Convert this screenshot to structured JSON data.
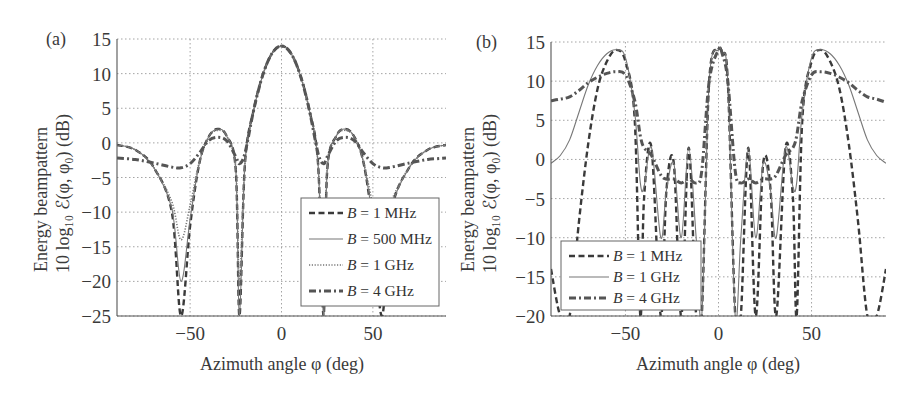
{
  "figure": {
    "panels": [
      {
        "tag": "(a)",
        "ylabel_line1": "Energy beampattern",
        "ylabel_line2": "10 log₁₀ ℰ(φ, φ₀) (dB)",
        "xlabel": "Azimuth angle φ (deg)",
        "yticks": [
          "15",
          "10",
          "5",
          "0",
          "−5",
          "−10",
          "−15",
          "−20",
          "−25"
        ],
        "xticks": [
          "−50",
          "0",
          "50"
        ],
        "legend": [
          "B = 1 MHz",
          "B = 500 MHz",
          "B = 1 GHz",
          "B = 4 GHz"
        ]
      },
      {
        "tag": "(b)",
        "ylabel_line1": "Energy beampattern",
        "ylabel_line2": "10 log₁₀ ℰ(φ, φ₀) (dB)",
        "xlabel": "Azimuth angle φ (deg)",
        "yticks": [
          "15",
          "10",
          "5",
          "0",
          "−5",
          "−10",
          "−15",
          "−20"
        ],
        "xticks": [
          "−50",
          "0",
          "50"
        ],
        "legend": [
          "B = 1 MHz",
          "B = 1 GHz",
          "B = 4 GHz"
        ]
      }
    ]
  },
  "chart_data": [
    {
      "type": "line",
      "panel": "(a)",
      "title": "",
      "xlabel": "Azimuth angle φ (deg)",
      "ylabel": "Energy beampattern 10 log10 ℰ(φ, φ0) (dB)",
      "xlim": [
        -90,
        90
      ],
      "ylim": [
        -25,
        15
      ],
      "grid": true,
      "legend_position": "lower right",
      "x": [
        -90,
        -80,
        -70,
        -60,
        -55,
        -50,
        -45,
        -40,
        -35,
        -30,
        -25,
        -23,
        -20,
        -15,
        -10,
        -5,
        0,
        5,
        10,
        15,
        20,
        23,
        25,
        30,
        35,
        40,
        45,
        50,
        55,
        60,
        70,
        80,
        90
      ],
      "series": [
        {
          "name": "B = 1 MHz",
          "style": "dashed",
          "values": [
            -0.3,
            -1.0,
            -3.5,
            -10,
            -25,
            -12,
            -3,
            0.8,
            2.0,
            1.0,
            -4,
            -25,
            -3,
            5,
            10,
            13,
            14,
            13,
            10,
            5,
            -3,
            -25,
            -4,
            1.0,
            2.0,
            0.8,
            -3,
            -12,
            -25,
            -10,
            -3.5,
            -1.0,
            -0.3
          ]
        },
        {
          "name": "B = 500 MHz",
          "style": "solid",
          "values": [
            -0.3,
            -1.0,
            -3.5,
            -9.5,
            -20,
            -11,
            -3,
            0.8,
            2.0,
            1.0,
            -4,
            -25,
            -3,
            5,
            10,
            13,
            14,
            13,
            10,
            5,
            -3,
            -25,
            -4,
            1.0,
            2.0,
            0.8,
            -3,
            -11,
            -20,
            -9.5,
            -3.5,
            -1.0,
            -0.3
          ]
        },
        {
          "name": "B = 1 GHz",
          "style": "dotted",
          "values": [
            -0.3,
            -1.0,
            -3.5,
            -8.5,
            -14,
            -9,
            -2.8,
            0.8,
            1.8,
            1.0,
            -3.5,
            -20,
            -3,
            5,
            10,
            13,
            14,
            13,
            10,
            5,
            -3,
            -20,
            -3.5,
            1.0,
            1.8,
            0.8,
            -2.8,
            -9,
            -14,
            -8.5,
            -3.5,
            -1.0,
            -0.3
          ]
        },
        {
          "name": "B = 4 GHz",
          "style": "dash-dot",
          "values": [
            -2.2,
            -2.4,
            -2.9,
            -3.5,
            -3.6,
            -3.0,
            -1.5,
            0.3,
            0.8,
            0.3,
            -2.0,
            -3.0,
            -1.5,
            5,
            10,
            13,
            14,
            13,
            10,
            5,
            -1.5,
            -3.0,
            -2.0,
            0.3,
            0.8,
            0.3,
            -1.5,
            -3.0,
            -3.6,
            -3.5,
            -2.9,
            -2.4,
            -2.2
          ]
        }
      ]
    },
    {
      "type": "line",
      "panel": "(b)",
      "title": "",
      "xlabel": "Azimuth angle φ (deg)",
      "ylabel": "Energy beampattern 10 log10 ℰ(φ, φ0) (dB)",
      "xlim": [
        -90,
        90
      ],
      "ylim": [
        -20,
        15
      ],
      "grid": true,
      "legend_position": "lower left",
      "x": [
        -90,
        -85,
        -80,
        -75,
        -70,
        -65,
        -60,
        -55,
        -50,
        -45,
        -42,
        -40,
        -36,
        -31,
        -28,
        -24,
        -20,
        -16,
        -12,
        -9,
        -5,
        0,
        2,
        5,
        9,
        12,
        16,
        20,
        24,
        28,
        31,
        36,
        40,
        42,
        45,
        50,
        55,
        60,
        65,
        70,
        75,
        80,
        85,
        90
      ],
      "series": [
        {
          "name": "B = 1 MHz",
          "style": "dashed",
          "values": [
            -14,
            -20,
            -20,
            -8,
            2,
            9,
            12.5,
            14,
            12.5,
            5,
            -20,
            -5,
            1.5,
            -20,
            -4,
            -0.5,
            -20,
            1.5,
            -20,
            -20,
            10,
            14,
            13.5,
            10,
            -20,
            -20,
            1.5,
            -20,
            -0.5,
            -4,
            -20,
            1.5,
            -5,
            -20,
            5,
            12.5,
            14,
            12.5,
            9,
            2,
            -8,
            -20,
            -20,
            -14
          ]
        },
        {
          "name": "B = 1 GHz",
          "style": "solid",
          "values": [
            -0.5,
            0.5,
            2.5,
            6,
            9.5,
            12,
            13.5,
            14,
            13,
            6,
            -3,
            -3.5,
            1.5,
            -10,
            -4,
            -0.5,
            -10,
            1.5,
            -10,
            -20,
            10,
            14,
            13.5,
            10,
            -20,
            -10,
            1.5,
            -10,
            -0.5,
            -4,
            -10,
            1.5,
            -3.5,
            -3,
            6,
            13,
            14,
            13.5,
            12,
            9.5,
            6,
            2.5,
            0.5,
            -0.5
          ]
        },
        {
          "name": "B = 4 GHz",
          "style": "dash-dot",
          "values": [
            7.5,
            7.7,
            8.0,
            8.8,
            9.8,
            10.5,
            11,
            11.2,
            10.8,
            7.5,
            3,
            1.5,
            0.5,
            -2.0,
            -2.5,
            -2.5,
            -3.0,
            -2.5,
            -3.0,
            -1.5,
            10,
            14,
            13.5,
            10,
            -1.5,
            -3.0,
            -2.5,
            -3.0,
            -2.5,
            -2.5,
            -2.0,
            0.5,
            1.5,
            3,
            7.5,
            10.8,
            11.2,
            11,
            10.5,
            9.8,
            8.8,
            8.0,
            7.7,
            7.3
          ]
        }
      ]
    }
  ]
}
